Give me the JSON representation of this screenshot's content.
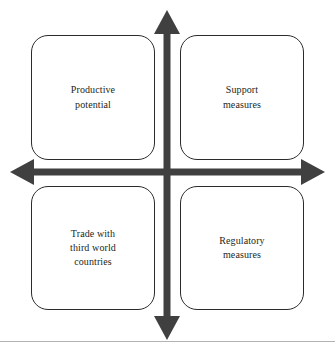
{
  "diagram": {
    "type": "quadrant-matrix",
    "title": "",
    "colors": {
      "axis": "#404040",
      "box_border": "#2b2b2b",
      "box_fill": "#ffffff",
      "text": "#231f20",
      "divider": "#b3b3b3",
      "background": "#ffffff"
    },
    "axes": {
      "vertical": {
        "name": "vertical-axis",
        "label": "",
        "arrowheads": [
          "up",
          "down"
        ]
      },
      "horizontal": {
        "name": "horizontal-axis",
        "label": "",
        "arrowheads": [
          "left",
          "right"
        ]
      },
      "center": {
        "x": 167,
        "y": 172
      }
    },
    "quadrants": [
      {
        "position": "top-left",
        "name": "quadrant-productive-potential",
        "label": "Productive\npotential"
      },
      {
        "position": "top-right",
        "name": "quadrant-support-measures",
        "label": "Support\nmeasures"
      },
      {
        "position": "bottom-left",
        "name": "quadrant-trade-with-third-world-countries",
        "label": "Trade with\nthird world\ncountries"
      },
      {
        "position": "bottom-right",
        "name": "quadrant-regulatory-measures",
        "label": "Regulatory\nmeasures"
      }
    ]
  }
}
